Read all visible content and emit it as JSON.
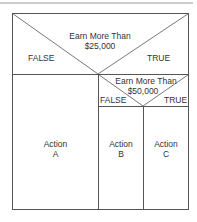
{
  "diagram": {
    "decision1": {
      "condition_line1": "Earn More Than",
      "condition_line2": "$25,000",
      "false_label": "FALSE",
      "true_label": "TRUE"
    },
    "decision2": {
      "condition_line1": "Earn More Than",
      "condition_line2": "$50,000",
      "false_label": "FALSE",
      "true_label": "TRUE"
    },
    "actions": [
      {
        "line1": "Action",
        "line2": "A"
      },
      {
        "line1": "Action",
        "line2": "B"
      },
      {
        "line1": "Action",
        "line2": "C"
      }
    ]
  }
}
